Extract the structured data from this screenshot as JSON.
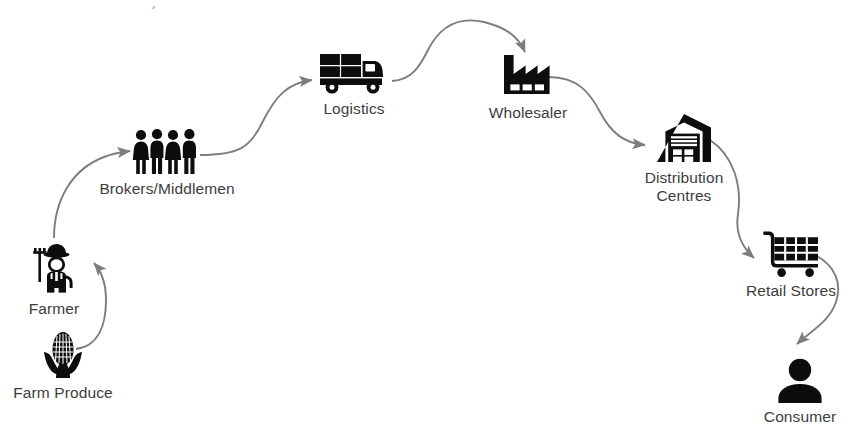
{
  "diagram": {
    "background_color": "#ffffff",
    "icon_color": "#0d0d0d",
    "label_color": "#3d3d3d",
    "arrow_color": "#7a7a7a",
    "nodes": [
      {
        "id": "farm-produce",
        "label": "Farm Produce",
        "icon": "corn-icon",
        "order": 1
      },
      {
        "id": "farmer",
        "label": "Farmer",
        "icon": "farmer-icon",
        "order": 2
      },
      {
        "id": "brokers",
        "label": "Brokers/Middlemen",
        "icon": "people-group-icon",
        "order": 3
      },
      {
        "id": "logistics",
        "label": "Logistics",
        "icon": "delivery-truck-icon",
        "order": 4
      },
      {
        "id": "wholesaler",
        "label": "Wholesaler",
        "icon": "factory-icon",
        "order": 5
      },
      {
        "id": "distribution",
        "label": "Distribution\nCentres",
        "icon": "warehouse-icon",
        "order": 6
      },
      {
        "id": "retail",
        "label": "Retail Stores",
        "icon": "shopping-cart-icon",
        "order": 7
      },
      {
        "id": "consumer",
        "label": "Consumer",
        "icon": "person-icon",
        "order": 8
      }
    ],
    "connections": [
      {
        "id": "produce-to-farmer",
        "from": "farm-produce",
        "to": "farmer",
        "style": "curved-arrow"
      },
      {
        "id": "farmer-to-brokers",
        "from": "farmer",
        "to": "brokers",
        "style": "curved-arrow"
      },
      {
        "id": "brokers-to-logistics",
        "from": "brokers",
        "to": "logistics",
        "style": "curved-arrow"
      },
      {
        "id": "logistics-to-wholesaler",
        "from": "logistics",
        "to": "wholesaler",
        "style": "curved-arrow"
      },
      {
        "id": "wholesaler-to-distribution",
        "from": "wholesaler",
        "to": "distribution",
        "style": "curved-arrow"
      },
      {
        "id": "distribution-to-retail",
        "from": "distribution",
        "to": "retail",
        "style": "curved-arrow"
      },
      {
        "id": "retail-to-consumer",
        "from": "retail",
        "to": "consumer",
        "style": "curved-arrow"
      }
    ]
  }
}
